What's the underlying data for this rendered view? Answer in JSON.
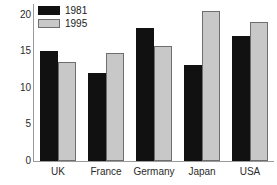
{
  "chart_data": {
    "type": "bar",
    "title": "",
    "xlabel": "",
    "ylabel": "",
    "categories": [
      "UK",
      "France",
      "Germany",
      "Japan",
      "USA"
    ],
    "series": [
      {
        "name": "1981",
        "color": "#111111",
        "values": [
          15.0,
          12.0,
          18.2,
          13.2,
          17.1
        ]
      },
      {
        "name": "1995",
        "color": "#c8c8c8",
        "values": [
          13.6,
          14.8,
          15.7,
          20.6,
          19.0
        ]
      }
    ],
    "ylim": [
      0,
      21.5
    ],
    "yticks": [
      0,
      5,
      10,
      15,
      20
    ],
    "ytick_labels": [
      "0",
      "5",
      "10",
      "15",
      "20"
    ],
    "grid": false,
    "legend_position": "top-left"
  },
  "legend": {
    "entries": [
      {
        "label": "1981"
      },
      {
        "label": "1995"
      }
    ]
  },
  "axes": {
    "y_tick_labels": [
      "20",
      "15",
      "10",
      "5",
      "0"
    ],
    "x_tick_labels": [
      "UK",
      "France",
      "Germany",
      "Japan",
      "USA"
    ]
  }
}
